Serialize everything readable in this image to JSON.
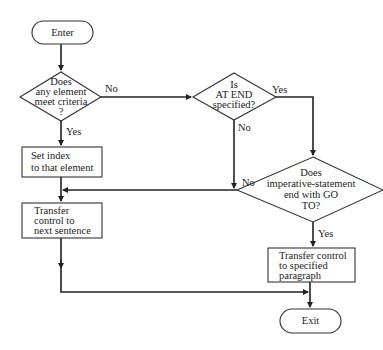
{
  "diagram": {
    "type": "flowchart",
    "nodes": {
      "enter": {
        "kind": "terminal",
        "text": "Enter"
      },
      "decision_criteria": {
        "kind": "decision",
        "lines": [
          "Does",
          "any element",
          "meet criteria",
          "?"
        ]
      },
      "set_index": {
        "kind": "process",
        "lines": [
          "Set index",
          "to that element"
        ]
      },
      "transfer_next": {
        "kind": "process",
        "lines": [
          "Transfer",
          "control to",
          "next sentence"
        ]
      },
      "decision_at_end": {
        "kind": "decision",
        "lines": [
          "Is",
          "AT END",
          "specified?"
        ]
      },
      "decision_goto": {
        "kind": "decision",
        "lines": [
          "Does",
          "imperative-statement",
          "end with GO",
          "TO?"
        ]
      },
      "transfer_specified": {
        "kind": "process",
        "lines": [
          "Transfer control",
          "to specified",
          "paragraph"
        ]
      },
      "exit": {
        "kind": "terminal",
        "text": "Exit"
      }
    },
    "edge_labels": {
      "criteria_no": "No",
      "criteria_yes": "Yes",
      "at_end_yes": "Yes",
      "at_end_no": "No",
      "goto_no": "No",
      "goto_yes": "Yes"
    },
    "edges": [
      {
        "from": "enter",
        "to": "decision_criteria"
      },
      {
        "from": "decision_criteria",
        "to": "decision_at_end",
        "label": "No"
      },
      {
        "from": "decision_criteria",
        "to": "set_index",
        "label": "Yes"
      },
      {
        "from": "set_index",
        "to": "transfer_next"
      },
      {
        "from": "decision_at_end",
        "to": "decision_goto",
        "label": "Yes"
      },
      {
        "from": "decision_at_end",
        "to": "transfer_next",
        "label": "No"
      },
      {
        "from": "decision_goto",
        "to": "transfer_next",
        "label": "No"
      },
      {
        "from": "decision_goto",
        "to": "transfer_specified",
        "label": "Yes"
      },
      {
        "from": "transfer_next",
        "to": "exit"
      },
      {
        "from": "transfer_specified",
        "to": "exit"
      }
    ]
  }
}
